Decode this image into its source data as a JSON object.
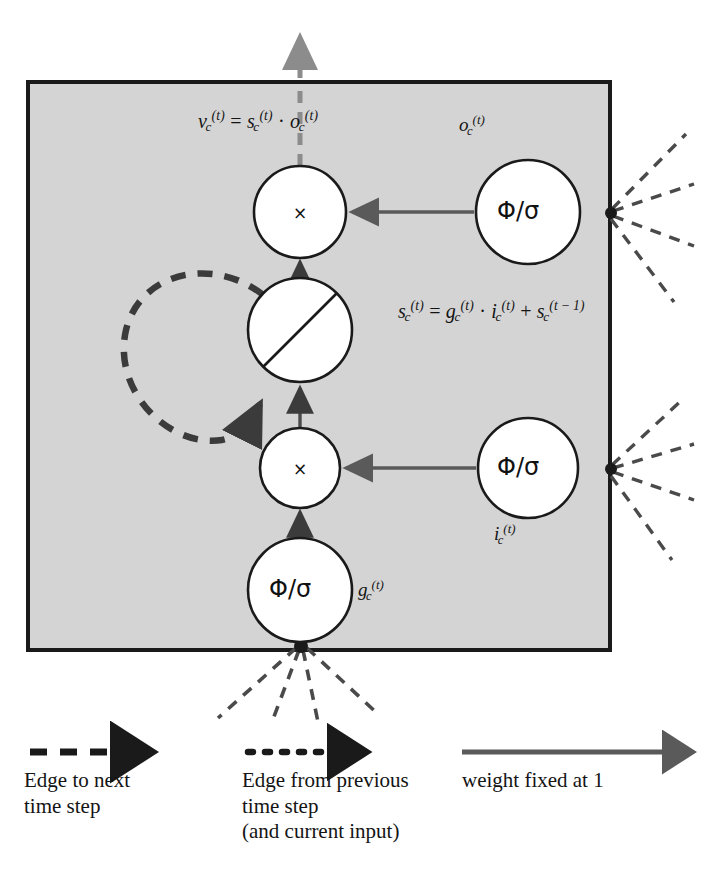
{
  "figure": {
    "box": {
      "fill": "#d4d4d4",
      "stroke": "#1a1a1a"
    },
    "colors": {
      "box_fill": "#d4d4d4",
      "box_stroke": "#1a1a1a",
      "node_fill": "#ffffff",
      "node_stroke": "#1a1a1a",
      "solid_edge": "#5a5a5a",
      "dashed_edge": "#4a4a4a",
      "text": "#141414"
    }
  },
  "equations": [
    {
      "id": "output-equation",
      "lhs": "v",
      "lhs_sub": "c",
      "lhs_sup": "(t)",
      "text": "v_c^(t) = s_c^(t) · o_c^(t)",
      "parts": [
        {
          "base": "v",
          "sub": "c",
          "sup": "(t)"
        },
        {
          "op": "="
        },
        {
          "base": "s",
          "sub": "c",
          "sup": "(t)"
        },
        {
          "op": "·"
        },
        {
          "base": "o",
          "sub": "c",
          "sup": "(t)"
        }
      ]
    },
    {
      "id": "state-equation",
      "text": "s_c^(t) = g_c^(t) · i_c^(t) + s_c^(t − 1)",
      "parts": [
        {
          "base": "s",
          "sub": "c",
          "sup": "(t)"
        },
        {
          "op": "="
        },
        {
          "base": "g",
          "sub": "c",
          "sup": "(t)"
        },
        {
          "op": "·"
        },
        {
          "base": "i",
          "sub": "c",
          "sup": "(t)"
        },
        {
          "op": "+"
        },
        {
          "base": "s",
          "sub": "c",
          "sup": "(t − 1)"
        }
      ]
    }
  ],
  "nodes": [
    {
      "id": "output-multiply-node",
      "glyph": "×",
      "kind": "multiply",
      "cx": 300,
      "cy": 212,
      "r": 46
    },
    {
      "id": "cell-state-node",
      "glyph": "",
      "kind": "linear-identity",
      "cx": 300,
      "cy": 330,
      "r": 52
    },
    {
      "id": "input-multiply-node",
      "glyph": "×",
      "kind": "multiply",
      "cx": 300,
      "cy": 468,
      "r": 40
    },
    {
      "id": "output-gate-node",
      "glyph": "Φ/σ",
      "kind": "gate",
      "cx": 528,
      "cy": 212,
      "r": 52
    },
    {
      "id": "input-gate-node",
      "glyph": "Φ/σ",
      "kind": "gate",
      "cx": 528,
      "cy": 468,
      "r": 50
    },
    {
      "id": "cell-input-node",
      "glyph": "Φ/σ",
      "kind": "gate",
      "cx": 300,
      "cy": 590,
      "r": 52
    }
  ],
  "node_labels": [
    {
      "id": "output-gate-label",
      "base": "o",
      "sub": "c",
      "sup": "(t)",
      "text": "o_c^(t)"
    },
    {
      "id": "input-gate-label",
      "base": "i",
      "sub": "c",
      "sup": "(t)",
      "text": "i_c^(t)"
    },
    {
      "id": "cell-input-label",
      "base": "g",
      "sub": "c",
      "sup": "(t)",
      "text": "g_c^(t)"
    }
  ],
  "legend": [
    {
      "id": "legend-edge-to-next",
      "arrow": "dashed-arrow",
      "lines": [
        "Edge to next",
        "time step"
      ]
    },
    {
      "id": "legend-edge-from-previous",
      "arrow": "dotted-arrow",
      "lines": [
        "Edge from previous",
        "time step",
        "(and current input)"
      ]
    },
    {
      "id": "legend-weight-fixed",
      "arrow": "solid-arrow",
      "lines": [
        "weight fixed at 1"
      ]
    }
  ]
}
